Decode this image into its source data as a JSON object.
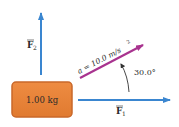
{
  "diagram": {
    "block": {
      "label": "1.00 kg",
      "color": "#e8823a",
      "border_color": "#c9682a"
    },
    "forces": {
      "F1": {
        "symbol": "F",
        "subscript": "1",
        "direction": "horizontal-right",
        "color": "#3a86d0"
      },
      "F2": {
        "symbol": "F",
        "subscript": "2",
        "direction": "vertical-up",
        "color": "#3a86d0"
      }
    },
    "acceleration": {
      "label": "a = 10.0 m/s",
      "exponent": "2",
      "angle_label": "30.0°",
      "angle_deg": 30.0,
      "color": "#a8338f"
    },
    "arc_color": "#333333"
  }
}
